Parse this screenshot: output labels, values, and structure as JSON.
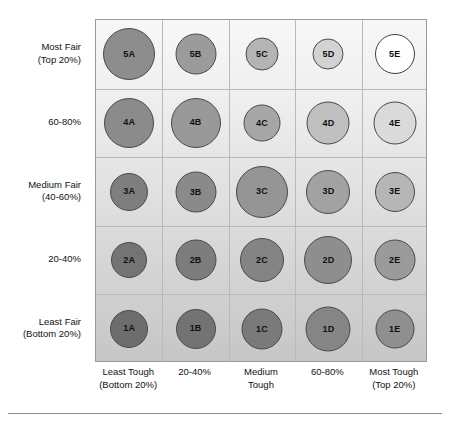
{
  "chart_data": {
    "type": "scatter",
    "title": "",
    "subtitle": "",
    "xlabel": "",
    "ylabel": "",
    "grid": true,
    "legend": false,
    "legend_position": "none",
    "x_categories": [
      "Least Tough\n(Bottom 20%)",
      "20-40%",
      "Medium\nTough",
      "60-80%",
      "Most Tough\n(Top 20%)"
    ],
    "y_categories": [
      "Least Fair\n(Bottom 20%)",
      "20-40%",
      "Medium Fair\n(40-60%)",
      "60-80%",
      "Most Fair\n(Top 20%)"
    ],
    "xlim": [
      0,
      5
    ],
    "ylim": [
      0,
      5
    ],
    "background_gradient": [
      "#f7f7f7",
      "#c6c6c6"
    ],
    "points": [
      {
        "label": "5A",
        "col": 1,
        "row": 5,
        "size": 52,
        "fill": "#8d8d8d",
        "stroke": "#4a4a4a"
      },
      {
        "label": "5B",
        "col": 2,
        "row": 5,
        "size": 41,
        "fill": "#9b9b9b",
        "stroke": "#4a4a4a"
      },
      {
        "label": "5C",
        "col": 3,
        "row": 5,
        "size": 33,
        "fill": "#b4b4b4",
        "stroke": "#4a4a4a"
      },
      {
        "label": "5D",
        "col": 4,
        "row": 5,
        "size": 31,
        "fill": "#d2d2d2",
        "stroke": "#4a4a4a"
      },
      {
        "label": "5E",
        "col": 5,
        "row": 5,
        "size": 40,
        "fill": "#ffffff",
        "stroke": "#3f3f3f"
      },
      {
        "label": "4A",
        "col": 1,
        "row": 4,
        "size": 50,
        "fill": "#8b8b8b",
        "stroke": "#4a4a4a"
      },
      {
        "label": "4B",
        "col": 2,
        "row": 4,
        "size": 50,
        "fill": "#999999",
        "stroke": "#4a4a4a"
      },
      {
        "label": "4C",
        "col": 3,
        "row": 4,
        "size": 37,
        "fill": "#a6a6a6",
        "stroke": "#4a4a4a"
      },
      {
        "label": "4D",
        "col": 4,
        "row": 4,
        "size": 43,
        "fill": "#bfbfbf",
        "stroke": "#4a4a4a"
      },
      {
        "label": "4E",
        "col": 5,
        "row": 4,
        "size": 43,
        "fill": "#dadada",
        "stroke": "#4a4a4a"
      },
      {
        "label": "3A",
        "col": 1,
        "row": 3,
        "size": 38,
        "fill": "#7e7e7e",
        "stroke": "#4a4a4a"
      },
      {
        "label": "3B",
        "col": 2,
        "row": 3,
        "size": 41,
        "fill": "#8a8a8a",
        "stroke": "#4a4a4a"
      },
      {
        "label": "3C",
        "col": 3,
        "row": 3,
        "size": 52,
        "fill": "#959595",
        "stroke": "#4a4a4a"
      },
      {
        "label": "3D",
        "col": 4,
        "row": 3,
        "size": 44,
        "fill": "#a2a2a2",
        "stroke": "#4a4a4a"
      },
      {
        "label": "3E",
        "col": 5,
        "row": 3,
        "size": 40,
        "fill": "#b6b6b6",
        "stroke": "#4a4a4a"
      },
      {
        "label": "2A",
        "col": 1,
        "row": 2,
        "size": 36,
        "fill": "#747474",
        "stroke": "#4a4a4a"
      },
      {
        "label": "2B",
        "col": 2,
        "row": 2,
        "size": 41,
        "fill": "#7d7d7d",
        "stroke": "#4a4a4a"
      },
      {
        "label": "2C",
        "col": 3,
        "row": 2,
        "size": 44,
        "fill": "#848484",
        "stroke": "#4a4a4a"
      },
      {
        "label": "2D",
        "col": 4,
        "row": 2,
        "size": 48,
        "fill": "#8e8e8e",
        "stroke": "#4a4a4a"
      },
      {
        "label": "2E",
        "col": 5,
        "row": 2,
        "size": 41,
        "fill": "#9a9a9a",
        "stroke": "#4a4a4a"
      },
      {
        "label": "1A",
        "col": 1,
        "row": 1,
        "size": 38,
        "fill": "#6d6d6d",
        "stroke": "#4a4a4a"
      },
      {
        "label": "1B",
        "col": 2,
        "row": 1,
        "size": 40,
        "fill": "#737373",
        "stroke": "#4a4a4a"
      },
      {
        "label": "1C",
        "col": 3,
        "row": 1,
        "size": 41,
        "fill": "#7a7a7a",
        "stroke": "#4a4a4a"
      },
      {
        "label": "1D",
        "col": 4,
        "row": 1,
        "size": 45,
        "fill": "#858585",
        "stroke": "#4a4a4a"
      },
      {
        "label": "1E",
        "col": 5,
        "row": 1,
        "size": 39,
        "fill": "#8f8f8f",
        "stroke": "#4a4a4a"
      }
    ]
  },
  "axes": {
    "y_labels": [
      {
        "line1": "Most Fair",
        "line2": "(Top 20%)",
        "row": 5
      },
      {
        "line1": "60-80%",
        "line2": "",
        "row": 4
      },
      {
        "line1": "Medium Fair",
        "line2": "(40-60%)",
        "row": 3
      },
      {
        "line1": "20-40%",
        "line2": "",
        "row": 2
      },
      {
        "line1": "Least Fair",
        "line2": "(Bottom 20%)",
        "row": 1
      }
    ],
    "x_labels": [
      {
        "line1": "Least Tough",
        "line2": "(Bottom 20%)",
        "col": 1
      },
      {
        "line1": "20-40%",
        "line2": "",
        "col": 2
      },
      {
        "line1": "Medium",
        "line2": "Tough",
        "col": 3
      },
      {
        "line1": "60-80%",
        "line2": "",
        "col": 4
      },
      {
        "line1": "Most Tough",
        "line2": "(Top 20%)",
        "col": 5
      }
    ]
  },
  "colors": {
    "plot_border": "#9a9a9a",
    "grid_line": "#b9b9b9",
    "footer_rule": "#8e8e8e",
    "text": "#111111"
  }
}
